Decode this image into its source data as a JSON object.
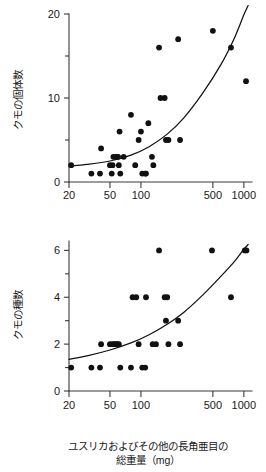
{
  "figure": {
    "background_color": "#ffffff",
    "point_color": "#111111",
    "axis_color": "#3a3a3a",
    "caption_line1": "ユスリカおよびその他の長角亜目の",
    "caption_line2": "総重量（mg）"
  },
  "chart_data": [
    {
      "type": "scatter",
      "panel": "top",
      "title": "",
      "xlabel": "",
      "ylabel": "クモの個体数",
      "x_scale": "log",
      "xlim": [
        20,
        1200
      ],
      "ylim": [
        0,
        20
      ],
      "x_ticks": [
        20,
        50,
        100,
        500,
        1000
      ],
      "x_tick_labels": [
        "20",
        "50",
        "100",
        "500",
        "1000"
      ],
      "y_ticks": [
        0,
        5,
        10,
        15,
        20
      ],
      "y_tick_labels": [
        "0",
        "",
        "10",
        "",
        "20"
      ],
      "y_major_ticks": [
        0,
        10,
        20
      ],
      "grid": false,
      "legend": null,
      "points": [
        {
          "x": 21,
          "y": 2
        },
        {
          "x": 33,
          "y": 1
        },
        {
          "x": 40,
          "y": 1
        },
        {
          "x": 41,
          "y": 4
        },
        {
          "x": 50,
          "y": 2
        },
        {
          "x": 52,
          "y": 1
        },
        {
          "x": 53,
          "y": 2
        },
        {
          "x": 54,
          "y": 3
        },
        {
          "x": 57,
          "y": 3
        },
        {
          "x": 58,
          "y": 3
        },
        {
          "x": 60,
          "y": 3
        },
        {
          "x": 61,
          "y": 2
        },
        {
          "x": 62,
          "y": 6
        },
        {
          "x": 63,
          "y": 1
        },
        {
          "x": 68,
          "y": 3
        },
        {
          "x": 80,
          "y": 8
        },
        {
          "x": 88,
          "y": 2
        },
        {
          "x": 95,
          "y": 5
        },
        {
          "x": 100,
          "y": 6
        },
        {
          "x": 103,
          "y": 1
        },
        {
          "x": 110,
          "y": 1
        },
        {
          "x": 112,
          "y": 1
        },
        {
          "x": 118,
          "y": 7
        },
        {
          "x": 128,
          "y": 3
        },
        {
          "x": 132,
          "y": 2
        },
        {
          "x": 150,
          "y": 16
        },
        {
          "x": 155,
          "y": 10
        },
        {
          "x": 170,
          "y": 10
        },
        {
          "x": 175,
          "y": 5
        },
        {
          "x": 185,
          "y": 5
        },
        {
          "x": 230,
          "y": 17
        },
        {
          "x": 240,
          "y": 5
        },
        {
          "x": 500,
          "y": 18
        },
        {
          "x": 750,
          "y": 16
        },
        {
          "x": 1050,
          "y": 12
        }
      ],
      "fit_curve": {
        "description": "exponential fit rising from about 2 at x=20 to above 20 at x=1050",
        "points": [
          {
            "x": 20,
            "y": 1.9
          },
          {
            "x": 30,
            "y": 2.1
          },
          {
            "x": 50,
            "y": 2.5
          },
          {
            "x": 80,
            "y": 3.2
          },
          {
            "x": 120,
            "y": 4.2
          },
          {
            "x": 180,
            "y": 5.7
          },
          {
            "x": 260,
            "y": 7.6
          },
          {
            "x": 400,
            "y": 10.6
          },
          {
            "x": 600,
            "y": 14.0
          },
          {
            "x": 800,
            "y": 17.0
          },
          {
            "x": 1000,
            "y": 19.9
          },
          {
            "x": 1100,
            "y": 21.0
          }
        ]
      }
    },
    {
      "type": "scatter",
      "panel": "bottom",
      "title": "",
      "xlabel": "ユスリカおよびその他の長角亜目の総重量（mg）",
      "ylabel": "クモの種数",
      "x_scale": "log",
      "xlim": [
        20,
        1200
      ],
      "ylim": [
        0,
        6.4
      ],
      "x_ticks": [
        20,
        50,
        100,
        500,
        1000
      ],
      "x_tick_labels": [
        "20",
        "50",
        "100",
        "500",
        "1000"
      ],
      "y_ticks": [
        0,
        1,
        2,
        3,
        4,
        5,
        6
      ],
      "y_tick_labels": [
        "0",
        "",
        "2",
        "",
        "4",
        "",
        "6"
      ],
      "y_major_ticks": [
        0,
        2,
        4,
        6
      ],
      "grid": false,
      "legend": null,
      "points": [
        {
          "x": 21,
          "y": 1
        },
        {
          "x": 33,
          "y": 1
        },
        {
          "x": 40,
          "y": 1
        },
        {
          "x": 41,
          "y": 2
        },
        {
          "x": 50,
          "y": 2
        },
        {
          "x": 53,
          "y": 2
        },
        {
          "x": 55,
          "y": 2
        },
        {
          "x": 57,
          "y": 2
        },
        {
          "x": 59,
          "y": 2
        },
        {
          "x": 61,
          "y": 2
        },
        {
          "x": 63,
          "y": 1
        },
        {
          "x": 80,
          "y": 1
        },
        {
          "x": 83,
          "y": 4
        },
        {
          "x": 90,
          "y": 4
        },
        {
          "x": 95,
          "y": 2
        },
        {
          "x": 103,
          "y": 1
        },
        {
          "x": 110,
          "y": 1
        },
        {
          "x": 112,
          "y": 4
        },
        {
          "x": 130,
          "y": 2
        },
        {
          "x": 140,
          "y": 2
        },
        {
          "x": 150,
          "y": 6
        },
        {
          "x": 170,
          "y": 4
        },
        {
          "x": 180,
          "y": 4
        },
        {
          "x": 175,
          "y": 3
        },
        {
          "x": 185,
          "y": 2
        },
        {
          "x": 230,
          "y": 3
        },
        {
          "x": 240,
          "y": 2
        },
        {
          "x": 490,
          "y": 6
        },
        {
          "x": 750,
          "y": 4
        },
        {
          "x": 1020,
          "y": 6
        },
        {
          "x": 1060,
          "y": 6
        }
      ],
      "fit_curve": {
        "description": "exponential fit rising from about 1.35 at x=20 to about 6.2 at x=1100",
        "points": [
          {
            "x": 20,
            "y": 1.35
          },
          {
            "x": 30,
            "y": 1.5
          },
          {
            "x": 50,
            "y": 1.75
          },
          {
            "x": 80,
            "y": 2.05
          },
          {
            "x": 120,
            "y": 2.4
          },
          {
            "x": 180,
            "y": 2.85
          },
          {
            "x": 260,
            "y": 3.35
          },
          {
            "x": 400,
            "y": 4.1
          },
          {
            "x": 600,
            "y": 4.9
          },
          {
            "x": 800,
            "y": 5.5
          },
          {
            "x": 1000,
            "y": 6.05
          },
          {
            "x": 1100,
            "y": 6.25
          }
        ]
      }
    }
  ]
}
